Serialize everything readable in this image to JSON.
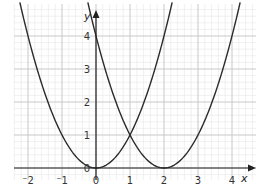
{
  "chart_data": {
    "type": "line",
    "title": "",
    "xlabel": "x",
    "ylabel": "y",
    "xlim": [
      -2.4,
      4.7
    ],
    "ylim": [
      0,
      4.9
    ],
    "grid": true,
    "minor_grid_per_unit": 5,
    "x_ticks": [
      "⁻2",
      "⁻1",
      "0",
      "1",
      "2",
      "3",
      "4"
    ],
    "x_tick_values": [
      -2,
      -1,
      0,
      1,
      2,
      3,
      4
    ],
    "y_ticks": [
      "1",
      "2",
      "3",
      "4"
    ],
    "y_tick_values": [
      1,
      2,
      3,
      4
    ],
    "origin_label": "0",
    "series": [
      {
        "name": "y = x²",
        "x": [
          -2.2,
          -2,
          -1,
          0,
          1,
          2,
          2.2
        ],
        "y": [
          4.84,
          4,
          1,
          0,
          1,
          4,
          4.84
        ]
      },
      {
        "name": "y = (x - 2)²",
        "x": [
          -0.2,
          0,
          1,
          2,
          3,
          4,
          4.2
        ],
        "y": [
          4.84,
          4,
          1,
          0,
          1,
          4,
          4.84
        ]
      }
    ],
    "intersection": {
      "x": 1,
      "y": 1
    },
    "colors": {
      "curve": "#2b2b2b",
      "axis": "#222222",
      "major_grid": "#c8c8c8",
      "minor_grid": "#e6e6e6"
    }
  }
}
